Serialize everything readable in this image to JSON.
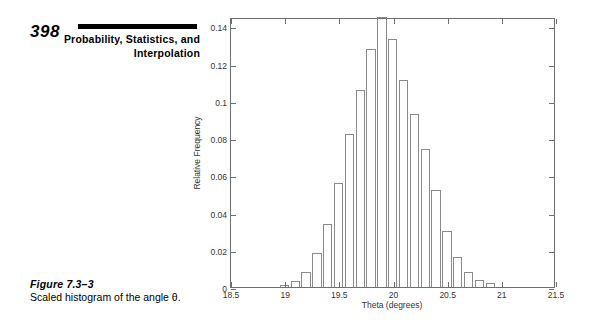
{
  "header": {
    "folio": "398",
    "chapter_title": "Probability, Statistics, and Interpolation"
  },
  "caption": {
    "label": "Figure 7.3–3",
    "text": "Scaled histogram of the angle θ."
  },
  "chart_data": {
    "type": "bar",
    "title": "",
    "xlabel": "Theta (degrees)",
    "ylabel": "Relative Frequency",
    "xlim": [
      18.5,
      21.5
    ],
    "ylim": [
      0,
      0.145
    ],
    "xticks": [
      "18.5",
      "19",
      "19.5",
      "20",
      "20.5",
      "21",
      "21.5"
    ],
    "xtick_values": [
      18.5,
      19,
      19.5,
      20,
      20.5,
      21,
      21.5
    ],
    "yticks": [
      "0",
      "0.02",
      "0.04",
      "0.06",
      "0.08",
      "0.1",
      "0.12",
      "0.14"
    ],
    "ytick_values": [
      0,
      0.02,
      0.04,
      0.06,
      0.08,
      0.1,
      0.12,
      0.14
    ],
    "grid": false,
    "legend": null,
    "bin_width": 0.1,
    "categories": [
      19.0,
      19.1,
      19.2,
      19.3,
      19.4,
      19.5,
      19.6,
      19.7,
      19.8,
      19.9,
      20.0,
      20.1,
      20.2,
      20.3,
      20.4,
      20.5,
      20.6,
      20.7,
      20.8,
      20.9
    ],
    "values": [
      0.001,
      0.003,
      0.008,
      0.018,
      0.034,
      0.056,
      0.082,
      0.106,
      0.128,
      0.145,
      0.133,
      0.111,
      0.093,
      0.074,
      0.052,
      0.03,
      0.016,
      0.008,
      0.004,
      0.002
    ]
  }
}
